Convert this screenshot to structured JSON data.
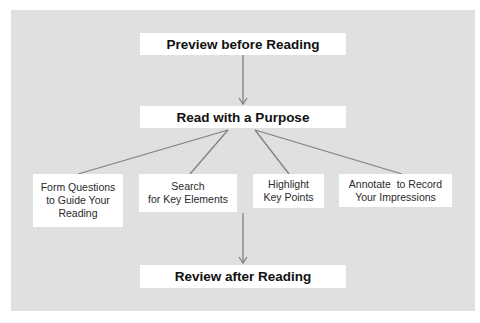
{
  "diagram": {
    "background_color": "#e0e0e0",
    "line_color": "#808080",
    "top_step": "Preview before Reading",
    "middle_step": "Read with a Purpose",
    "bottom_step": "Review after Reading",
    "sub_steps": [
      {
        "line1": "Form Questions",
        "line2": "to Guide Your",
        "line3": "Reading"
      },
      {
        "line1": "Search",
        "line2": "for Key Elements"
      },
      {
        "line1": "Highlight",
        "line2": "Key Points"
      },
      {
        "line1": "Annotate  to Record",
        "line2": "Your Impressions"
      }
    ]
  }
}
